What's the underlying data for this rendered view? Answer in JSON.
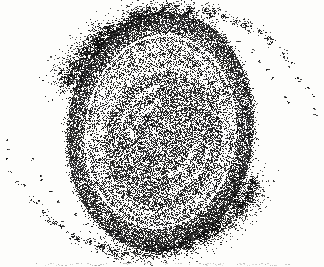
{
  "figure": {
    "alt": "stippled-halftone-spiral-galaxy-illustration",
    "paper": "#fdfdfb",
    "ink": "#141414"
  },
  "canvas": {
    "width": 324,
    "height": 267,
    "seed": 1973
  },
  "galaxy": {
    "center": {
      "x": 160,
      "y": 131
    },
    "disk": {
      "rx": 93,
      "ry": 120,
      "rotation_deg": 6
    },
    "core": {
      "cx": 163,
      "cy": 139,
      "rx": 58,
      "ry": 68,
      "rotation_deg": 15,
      "ink_p": 0.55,
      "center_p": 0.48
    },
    "band": {
      "ink_p": 0.3
    },
    "gap": {
      "u_min": 0.79,
      "u_max": 0.815,
      "ink_p": 0.17
    },
    "ring": {
      "p_inner": 0.55,
      "p_outer": 0.78,
      "bump1_deg": -115,
      "bump2_deg": 65,
      "bump_width_deg": 40,
      "bump_p": 0.1
    },
    "edge": {
      "u_max": 1.08,
      "p": 0.55
    },
    "dark_arcs": [
      {
        "u_min": 0.755,
        "u_max": 0.79,
        "a0": -175,
        "a1": -30,
        "p": 0.52
      },
      {
        "u_min": 0.755,
        "u_max": 0.79,
        "a0": 5,
        "a1": 150,
        "p": 0.52
      },
      {
        "u_min": 0.64,
        "u_max": 0.67,
        "a0": 35,
        "a1": 150,
        "p": 0.48
      },
      {
        "u_min": 0.64,
        "u_max": 0.67,
        "a0": -145,
        "a1": -30,
        "p": 0.48
      },
      {
        "u_min": 0.7,
        "u_max": 0.73,
        "a0": 60,
        "a1": 140,
        "p": 0.45
      }
    ],
    "core_streaks": [
      {
        "a0": -175,
        "a1": -95
      },
      {
        "a0": 5,
        "a1": 85
      }
    ],
    "arms": {
      "theta0_deg": -150,
      "theta1_deg": -5,
      "r0": 120,
      "r_ref_deg": -105,
      "pitch_k": 0.154,
      "y_scale": 0.97,
      "clumps": 40,
      "size_max": 11,
      "size_min": 1.3,
      "dots_max": 150,
      "dots_min": 3,
      "mirror": true,
      "inner_chain": {
        "theta0_deg": -95,
        "theta1_deg": -12,
        "r_factor": 0.86,
        "clumps": 14,
        "size": 1.4,
        "dots": 5
      }
    }
  },
  "caption_remnant": {
    "y": 263,
    "x_start": 36,
    "x_end": 292,
    "alpha_min": 0.1,
    "alpha_max": 0.32,
    "note": "top edge of a cropped, illegible caption line"
  }
}
